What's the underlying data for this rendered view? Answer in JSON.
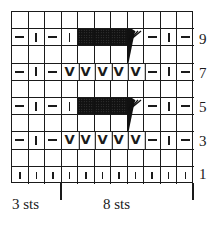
{
  "chart": {
    "columns": 11,
    "rows": 10,
    "legend_symbols": {
      "purl": "purl-dash",
      "knit": "knit-bar",
      "slip": "slip-v",
      "wrap": "black-shaded-block",
      "gather": "fan-wedge"
    },
    "grid_rows_top_to_bottom": [
      [
        "",
        "",
        "",
        "",
        "",
        "",
        "",
        "",
        "",
        "",
        ""
      ],
      [
        "purl",
        "knit",
        "purl",
        "knit",
        "wrap",
        "wrap",
        "wrap",
        "gather",
        "purl",
        "knit",
        "purl"
      ],
      [
        "",
        "",
        "",
        "",
        "",
        "",
        "",
        "",
        "",
        "",
        ""
      ],
      [
        "purl",
        "knit",
        "purl",
        "slip",
        "slip",
        "slip",
        "slip",
        "slip",
        "purl",
        "knit",
        "purl"
      ],
      [
        "",
        "",
        "",
        "",
        "",
        "",
        "",
        "",
        "",
        "",
        ""
      ],
      [
        "purl",
        "knit",
        "purl",
        "knit",
        "wrap",
        "wrap",
        "wrap",
        "gather",
        "purl",
        "knit",
        "purl"
      ],
      [
        "",
        "",
        "",
        "",
        "",
        "",
        "",
        "",
        "",
        "",
        ""
      ],
      [
        "purl",
        "knit",
        "purl",
        "slip",
        "slip",
        "slip",
        "slip",
        "slip",
        "purl",
        "knit",
        "purl"
      ],
      [
        "",
        "",
        "",
        "",
        "",
        "",
        "",
        "",
        "",
        "",
        ""
      ],
      [
        "knitsm",
        "knitsm",
        "knitsm",
        "knitsm",
        "knitsm",
        "knitsm",
        "knitsm",
        "knitsm",
        "knitsm",
        "knitsm",
        "knitsm"
      ]
    ],
    "row_labels": [
      {
        "label": "9",
        "row_index": 1
      },
      {
        "label": "7",
        "row_index": 3
      },
      {
        "label": "5",
        "row_index": 5
      },
      {
        "label": "3",
        "row_index": 7
      },
      {
        "label": "1",
        "row_index": 9
      }
    ],
    "repeat_labels": {
      "edge": "3 sts",
      "repeat": "8 sts"
    },
    "colors": {
      "ink": "#1a1a1a",
      "background": "#ffffff"
    }
  }
}
